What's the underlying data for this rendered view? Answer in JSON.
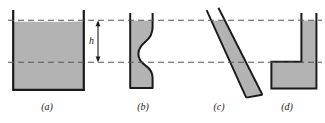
{
  "figure": {
    "background_color": "#ffffff",
    "fill_color": "#b3b3b3",
    "outline_color": "#1a1a1a",
    "dash_color": "#555555",
    "surface_line_y": 20,
    "depth_line_y": 62,
    "dimension": {
      "symbol": "h",
      "name": "depth-label"
    },
    "panels": [
      {
        "id": "a",
        "caption": "(a)",
        "shape_name": "rectangular-tank",
        "caption_x": 27,
        "caption_y": 101
      },
      {
        "id": "b",
        "caption": "(b)",
        "shape_name": "curved-bulging-tube",
        "caption_x": 123,
        "caption_y": 101
      },
      {
        "id": "c",
        "caption": "(c)",
        "shape_name": "tilted-slab-tube",
        "caption_x": 199,
        "caption_y": 101
      },
      {
        "id": "d",
        "caption": "(d)",
        "shape_name": "l-shaped-vessel",
        "caption_x": 267,
        "caption_y": 101
      }
    ]
  }
}
